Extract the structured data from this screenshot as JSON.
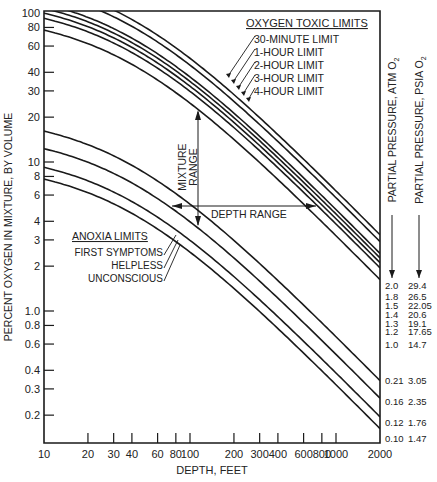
{
  "chart_data": {
    "type": "line",
    "title": "",
    "xlabel": "DEPTH, FEET",
    "ylabel": "PERCENT OXYGEN IN MIXTURE, BY VOLUME",
    "xscale": "log",
    "yscale": "log",
    "xlim": [
      10,
      2000
    ],
    "ylim": [
      0.13,
      100
    ],
    "grid": false,
    "x_ticks": [
      10,
      20,
      30,
      40,
      60,
      80,
      100,
      200,
      300,
      400,
      600,
      800,
      1000,
      2000
    ],
    "x_tick_labels": [
      "10",
      "20",
      "30 40",
      "",
      "60",
      "80",
      "100",
      "200",
      "300",
      "400",
      "600",
      "800",
      "1000",
      "2000"
    ],
    "y_ticks": [
      100,
      80,
      60,
      40,
      30,
      20,
      10,
      8,
      6,
      4,
      3,
      2,
      1.0,
      0.8,
      0.6,
      0.4,
      0.3,
      0.2
    ],
    "y_tick_labels": [
      "100",
      "80",
      "60",
      "40",
      "30",
      "20",
      "10",
      "8",
      "6",
      "4",
      "3",
      "2",
      "1.0",
      "0.8",
      "0.6",
      "0.4",
      "0.3",
      "0.2"
    ],
    "formula": "percent_O2 = partial_pressure_atm / (depth_ft/33 + 1) * 100",
    "right_axis_labels": {
      "atm": "PARTIAL PRESSURE, ATM O2",
      "psia": "PARTIAL PRESSURE, PSIA O2"
    },
    "series": [
      {
        "name": "30-MINUTE LIMIT",
        "atm": "2.0",
        "psia": "29.4",
        "pp": 2.0,
        "group": "toxic"
      },
      {
        "name": "1-HOUR LIMIT",
        "atm": "1.8",
        "psia": "26.5",
        "pp": 1.8,
        "group": "toxic"
      },
      {
        "name": "2-HOUR LIMIT",
        "atm": "1.5",
        "psia": "22.05",
        "pp": 1.5,
        "group": "toxic"
      },
      {
        "name": "3-HOUR LIMIT",
        "atm": "1.4",
        "psia": "20.6",
        "pp": 1.4,
        "group": "toxic"
      },
      {
        "name": "4-HOUR LIMIT",
        "atm": "1.3",
        "psia": "19.1",
        "pp": 1.3,
        "group": "toxic"
      },
      {
        "name": "",
        "atm": "1.2",
        "psia": "17.65",
        "pp": 1.2,
        "group": "toxic"
      },
      {
        "name": "",
        "atm": "1.0",
        "psia": "14.7",
        "pp": 1.0,
        "group": "toxic"
      },
      {
        "name": "",
        "atm": "0.21",
        "psia": "3.05",
        "pp": 0.21,
        "group": "anoxia"
      },
      {
        "name": "FIRST SYMPTOMS",
        "atm": "0.16",
        "psia": "2.35",
        "pp": 0.16,
        "group": "anoxia"
      },
      {
        "name": "HELPLESS",
        "atm": "0.12",
        "psia": "1.76",
        "pp": 0.12,
        "group": "anoxia"
      },
      {
        "name": "UNCONSCIOUS",
        "atm": "0.10",
        "psia": "1.47",
        "pp": 0.1,
        "group": "anoxia"
      }
    ],
    "annotations": {
      "toxic_title": "OXYGEN TOXIC LIMITS",
      "toxic_items": [
        "30-MINUTE LIMIT",
        "1-HOUR LIMIT",
        "2-HOUR LIMIT",
        "3-HOUR LIMIT",
        "4-HOUR LIMIT"
      ],
      "anoxia_title": "ANOXIA LIMITS",
      "anoxia_items": [
        "FIRST SYMPTOMS",
        "HELPLESS",
        "UNCONSCIOUS"
      ],
      "mixture_range_line1": "MIXTURE",
      "mixture_range_line2": "RANGE",
      "depth_range": "DEPTH RANGE"
    }
  }
}
